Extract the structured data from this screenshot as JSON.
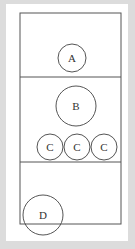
{
  "diagram": {
    "colors": {
      "background": "#dcdcdc",
      "panel": "#ffffff",
      "stroke": "#555555",
      "text": "#333333"
    },
    "box": {
      "x": 20,
      "y": 13,
      "width": 101,
      "height": 211
    },
    "dividers": [
      77,
      162
    ],
    "circles": [
      {
        "id": "A",
        "label": "A",
        "cx": 72,
        "cy": 58,
        "r": 14
      },
      {
        "id": "B",
        "label": "B",
        "cx": 76,
        "cy": 106,
        "r": 20
      },
      {
        "id": "C1",
        "label": "C",
        "cx": 50,
        "cy": 147,
        "r": 13
      },
      {
        "id": "C2",
        "label": "C",
        "cx": 77,
        "cy": 147,
        "r": 13
      },
      {
        "id": "C3",
        "label": "C",
        "cx": 104,
        "cy": 147,
        "r": 13
      },
      {
        "id": "D",
        "label": "D",
        "cx": 43,
        "cy": 215,
        "r": 20
      }
    ]
  }
}
